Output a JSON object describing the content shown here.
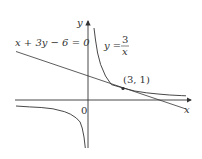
{
  "figure": {
    "axes": {
      "x_label": "x",
      "y_label": "y",
      "origin_label": "0"
    },
    "line": {
      "equation": "x + 3y − 6 = 0"
    },
    "curve": {
      "lhs": "y =",
      "numerator": "3",
      "denominator": "x"
    },
    "point": {
      "label": "(3, 1)"
    }
  },
  "colors": {
    "stroke": "#333333",
    "background": "#ffffff"
  }
}
